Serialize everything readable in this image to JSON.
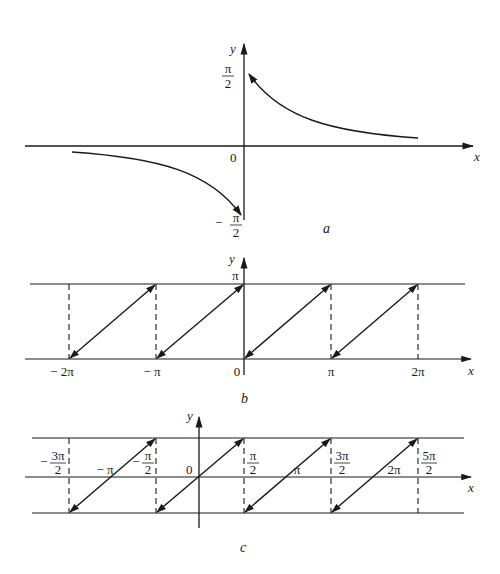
{
  "figure": {
    "panels": [
      {
        "id": "a",
        "label": "a",
        "axes": {
          "x_label": "x",
          "y_label": "y",
          "origin_label": "0"
        },
        "y_ticks": [
          {
            "num": "π",
            "den": "2",
            "sign": ""
          },
          {
            "num": "π",
            "den": "2",
            "sign": "−"
          }
        ],
        "description": "Graph of arccot-like function: branch in quadrant I decaying from π/2 toward 0, branch in quadrant III rising from −π/2 toward 0"
      },
      {
        "id": "b",
        "label": "b",
        "axes": {
          "x_label": "x",
          "y_label": "y"
        },
        "y_tick": "π",
        "x_ticks": [
          "− 2π",
          "− π",
          "0",
          "π",
          "2π"
        ],
        "description": "Sawtooth: segments from (kπ, 0) to ((k+1)π, π) with dashed verticals at multiples of π"
      },
      {
        "id": "c",
        "label": "c",
        "axes": {
          "x_label": "x",
          "y_label": "y",
          "origin_label": "0"
        },
        "x_ticks_fraction": [
          {
            "sign": "−",
            "num": "3π",
            "den": "2"
          },
          {
            "sign": "−",
            "num": "π",
            "den": "2"
          },
          {
            "sign": "",
            "num": "π",
            "den": "2"
          },
          {
            "sign": "",
            "num": "3π",
            "den": "2"
          },
          {
            "sign": "",
            "num": "5π",
            "den": "2"
          }
        ],
        "x_ticks_integer": [
          "− π",
          "π",
          "2π"
        ],
        "description": "Sawtooth centered on x-axis: segments from (−π/2 + kπ, −) to (π/2 + kπ, +) crossing zero at kπ"
      }
    ]
  }
}
